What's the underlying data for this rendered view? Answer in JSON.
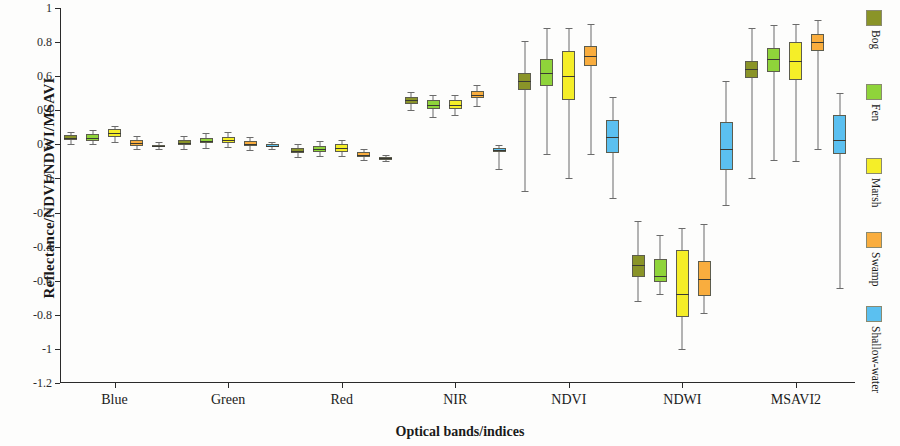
{
  "chart_data": {
    "type": "boxplot",
    "title": "",
    "xlabel": "Optical bands/indices",
    "ylabel": "Reflectance/NDVI/NDWI/MSAVI",
    "ylim": [
      -1.2,
      1.0
    ],
    "ytick_labels": [
      "1",
      "0.8",
      "0.6",
      "0.4",
      "0.2",
      "0",
      "-0.2",
      "-0.4",
      "-0.6",
      "-0.8",
      "-1",
      "-1.2"
    ],
    "ytick_values": [
      1,
      0.8,
      0.6,
      0.4,
      0.2,
      0,
      -0.2,
      -0.4,
      -0.6,
      -0.8,
      -1,
      -1.2
    ],
    "categories": [
      "Blue",
      "Green",
      "Red",
      "NIR",
      "NDVI",
      "NDWI",
      "MSAVI2"
    ],
    "grid": false,
    "legend_position": "right",
    "series": [
      {
        "name": "Bog",
        "color": "#8a9428",
        "boxes": [
          {
            "category": "Blue",
            "min": 0.205,
            "q1": 0.225,
            "median": 0.24,
            "q3": 0.255,
            "max": 0.275
          },
          {
            "category": "Green",
            "min": 0.175,
            "q1": 0.195,
            "median": 0.21,
            "q3": 0.228,
            "max": 0.25
          },
          {
            "category": "Red",
            "min": 0.125,
            "q1": 0.148,
            "median": 0.163,
            "q3": 0.18,
            "max": 0.205
          },
          {
            "category": "NIR",
            "min": 0.4,
            "q1": 0.437,
            "median": 0.458,
            "q3": 0.478,
            "max": 0.505
          },
          {
            "category": "NDVI",
            "min": -0.075,
            "q1": 0.52,
            "median": 0.57,
            "q3": 0.62,
            "max": 0.805
          },
          {
            "category": "NDWI",
            "min": -0.72,
            "q1": -0.58,
            "median": -0.51,
            "q3": -0.45,
            "max": -0.25
          },
          {
            "category": "MSAVI2",
            "min": 0.0,
            "q1": 0.59,
            "median": 0.64,
            "q3": 0.69,
            "max": 0.88
          }
        ]
      },
      {
        "name": "Fen",
        "color": "#8fd43a",
        "boxes": [
          {
            "category": "Blue",
            "min": 0.2,
            "q1": 0.222,
            "median": 0.24,
            "q3": 0.258,
            "max": 0.285
          },
          {
            "category": "Green",
            "min": 0.18,
            "q1": 0.205,
            "median": 0.222,
            "q3": 0.24,
            "max": 0.265
          },
          {
            "category": "Red",
            "min": 0.13,
            "q1": 0.155,
            "median": 0.172,
            "q3": 0.192,
            "max": 0.218
          },
          {
            "category": "NIR",
            "min": 0.36,
            "q1": 0.408,
            "median": 0.432,
            "q3": 0.458,
            "max": 0.49
          },
          {
            "category": "NDVI",
            "min": 0.145,
            "q1": 0.54,
            "median": 0.62,
            "q3": 0.7,
            "max": 0.88
          },
          {
            "category": "NDWI",
            "min": -0.68,
            "q1": -0.61,
            "median": -0.57,
            "q3": -0.47,
            "max": -0.33
          },
          {
            "category": "MSAVI2",
            "min": 0.11,
            "q1": 0.625,
            "median": 0.7,
            "q3": 0.765,
            "max": 0.9
          }
        ]
      },
      {
        "name": "Marsh",
        "color": "#f5ee28",
        "boxes": [
          {
            "category": "Blue",
            "min": 0.215,
            "q1": 0.243,
            "median": 0.265,
            "q3": 0.288,
            "max": 0.31
          },
          {
            "category": "Green",
            "min": 0.185,
            "q1": 0.208,
            "median": 0.225,
            "q3": 0.245,
            "max": 0.27
          },
          {
            "category": "Red",
            "min": 0.13,
            "q1": 0.158,
            "median": 0.178,
            "q3": 0.2,
            "max": 0.228
          },
          {
            "category": "NIR",
            "min": 0.375,
            "q1": 0.408,
            "median": 0.432,
            "q3": 0.458,
            "max": 0.488
          },
          {
            "category": "NDVI",
            "min": 0.0,
            "q1": 0.46,
            "median": 0.6,
            "q3": 0.745,
            "max": 0.885
          },
          {
            "category": "NDWI",
            "min": -1.0,
            "q1": -0.81,
            "median": -0.68,
            "q3": -0.42,
            "max": -0.29
          },
          {
            "category": "MSAVI2",
            "min": 0.105,
            "q1": 0.575,
            "median": 0.69,
            "q3": 0.8,
            "max": 0.905
          }
        ]
      },
      {
        "name": "Swamp",
        "color": "#f9ad3e",
        "boxes": [
          {
            "category": "Blue",
            "min": 0.17,
            "q1": 0.192,
            "median": 0.208,
            "q3": 0.228,
            "max": 0.25
          },
          {
            "category": "Green",
            "min": 0.165,
            "q1": 0.188,
            "median": 0.205,
            "q3": 0.222,
            "max": 0.245
          },
          {
            "category": "Red",
            "min": 0.108,
            "q1": 0.125,
            "median": 0.14,
            "q3": 0.155,
            "max": 0.175
          },
          {
            "category": "NIR",
            "min": 0.425,
            "q1": 0.472,
            "median": 0.492,
            "q3": 0.515,
            "max": 0.548
          },
          {
            "category": "NDVI",
            "min": 0.145,
            "q1": 0.66,
            "median": 0.72,
            "q3": 0.775,
            "max": 0.905
          },
          {
            "category": "NDWI",
            "min": -0.79,
            "q1": -0.69,
            "median": -0.59,
            "q3": -0.485,
            "max": -0.27
          },
          {
            "category": "MSAVI2",
            "min": 0.175,
            "q1": 0.745,
            "median": 0.8,
            "q3": 0.85,
            "max": 0.93
          }
        ]
      },
      {
        "name": "Shallow-water",
        "color": "#5bc0f0",
        "boxes": [
          {
            "category": "Blue",
            "min": 0.17,
            "q1": 0.185,
            "median": 0.192,
            "q3": 0.198,
            "max": 0.212
          },
          {
            "category": "Green",
            "min": 0.172,
            "q1": 0.186,
            "median": 0.192,
            "q3": 0.2,
            "max": 0.212
          },
          {
            "category": "Red",
            "min": 0.1,
            "q1": 0.11,
            "median": 0.118,
            "q3": 0.125,
            "max": 0.135
          },
          {
            "category": "NIR",
            "min": 0.055,
            "q1": 0.155,
            "median": 0.168,
            "q3": 0.18,
            "max": 0.195
          },
          {
            "category": "NDVI",
            "min": -0.115,
            "q1": 0.15,
            "median": 0.245,
            "q3": 0.34,
            "max": 0.48
          },
          {
            "category": "NDWI",
            "min": -0.155,
            "q1": 0.05,
            "median": 0.175,
            "q3": 0.33,
            "max": 0.57
          },
          {
            "category": "MSAVI2",
            "min": -0.64,
            "q1": 0.145,
            "median": 0.225,
            "q3": 0.37,
            "max": 0.5
          }
        ]
      }
    ]
  },
  "legend": {
    "items": [
      {
        "label": "Bog",
        "color": "#8a9428"
      },
      {
        "label": "Fen",
        "color": "#8fd43a"
      },
      {
        "label": "Marsh",
        "color": "#f5ee28"
      },
      {
        "label": "Swamp",
        "color": "#f9ad3e"
      },
      {
        "label": "Shallow-water",
        "color": "#5bc0f0"
      }
    ]
  }
}
